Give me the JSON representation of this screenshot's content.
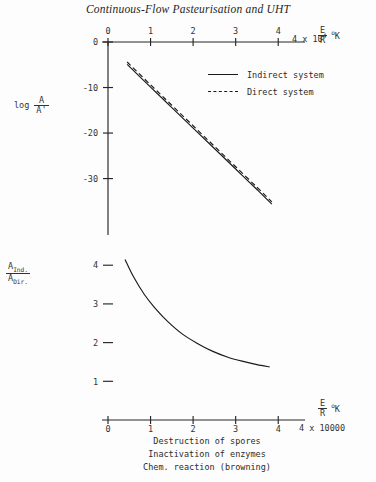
{
  "running_head": "Continuous-Flow Pasteurisation and UHT",
  "legend": {
    "items": [
      {
        "key": "solid-line",
        "label": "Indirect system"
      },
      {
        "key": "dashed-line",
        "label": "Direct system"
      }
    ]
  },
  "caption_lines": [
    "Destruction of spores",
    "Inactivation of enzymes",
    "Chem. reaction (browning)"
  ],
  "axis_annotations": {
    "top_x_numerator": "E",
    "top_x_denominator": "R",
    "top_x_unit_deg": "o",
    "top_x_unit_k": "K",
    "top_x_multiplier_value": "4 x 10",
    "top_x_multiplier_exp": "4",
    "bottom_x_numerator": "E",
    "bottom_x_denominator": "R",
    "bottom_x_unit_deg": "o",
    "bottom_x_unit_k": "K",
    "bottom_x_multiplier": "4 x 10000",
    "top_y_log": "log",
    "top_y_numerator": "A",
    "top_y_denominator": "A'",
    "bottom_y_num_base": "A",
    "bottom_y_num_sub": "Ind.",
    "bottom_y_den_base": "A",
    "bottom_y_den_sub": "Dir."
  },
  "chart_data": [
    {
      "id": "top-plot",
      "type": "line",
      "title": "",
      "xlabel": "E/R oK",
      "ylabel": "log A/A'",
      "xlim": [
        0,
        4.3
      ],
      "ylim": [
        -38,
        0
      ],
      "xticks": [
        0,
        1,
        2,
        3,
        4
      ],
      "xtick_labels": [
        "0",
        "1",
        "2",
        "3",
        "4"
      ],
      "yticks": [
        0,
        -10,
        -20,
        -30
      ],
      "ytick_labels": [
        "0",
        "-10",
        "-20",
        "-30"
      ],
      "grid": false,
      "legend_position": "upper-right",
      "x_multiplier": 10000,
      "series": [
        {
          "name": "Indirect system",
          "style": "solid",
          "x": [
            0.45,
            1.0,
            1.5,
            2.0,
            2.5,
            3.0,
            3.5,
            3.85
          ],
          "y": [
            -4.9,
            -9.9,
            -14.4,
            -18.9,
            -23.4,
            -27.9,
            -32.4,
            -35.6
          ]
        },
        {
          "name": "Direct system",
          "style": "dashed",
          "x": [
            0.45,
            1.0,
            1.5,
            2.0,
            2.5,
            3.0,
            3.5,
            3.85
          ],
          "y": [
            -4.4,
            -9.4,
            -13.9,
            -18.4,
            -22.9,
            -27.4,
            -31.9,
            -35.1
          ]
        }
      ]
    },
    {
      "id": "bottom-plot",
      "type": "line",
      "title": "",
      "xlabel": "E/R oK",
      "ylabel": "A Ind./A Dir.",
      "xlim": [
        0,
        4.3
      ],
      "ylim": [
        0,
        4.6
      ],
      "xticks": [
        0,
        1,
        2,
        3,
        4
      ],
      "xtick_labels": [
        "0",
        "1",
        "2",
        "3",
        "4"
      ],
      "yticks": [
        1,
        2,
        3,
        4
      ],
      "ytick_labels": [
        "1",
        "2",
        "3",
        "4"
      ],
      "grid": false,
      "x_multiplier": 10000,
      "series": [
        {
          "name": "A Ind./A Dir.",
          "style": "solid",
          "x": [
            0.4,
            0.6,
            0.85,
            1.1,
            1.4,
            1.75,
            2.1,
            2.45,
            2.8,
            3.15,
            3.5,
            3.8
          ],
          "y": [
            4.15,
            3.7,
            3.25,
            2.9,
            2.55,
            2.22,
            1.98,
            1.78,
            1.63,
            1.52,
            1.43,
            1.37
          ]
        }
      ]
    }
  ]
}
